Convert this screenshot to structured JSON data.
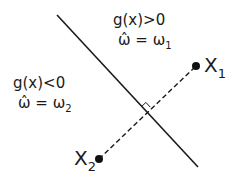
{
  "diagram": {
    "type": "linear-decision-boundary",
    "regions": {
      "positive": {
        "condition": "g(x)>0",
        "decision_hat": "ω̂",
        "decision_eq": "=",
        "decision_class": "ω",
        "decision_sub": "1"
      },
      "negative": {
        "condition": "g(x)<0",
        "decision_hat": "ω̂",
        "decision_eq": "=",
        "decision_class": "ω",
        "decision_sub": "2"
      }
    },
    "points": [
      {
        "label": "X",
        "sub": "1"
      },
      {
        "label": "X",
        "sub": "2"
      }
    ],
    "colors": {
      "ink": "#1a1a1a",
      "background": "#ffffff"
    }
  }
}
